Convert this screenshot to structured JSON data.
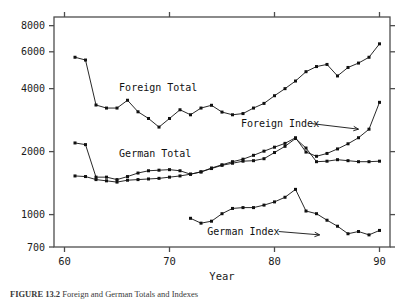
{
  "figure": {
    "caption_label": "FIGURE 13.2",
    "caption_text": "Foreign and German Totals and Indexes"
  },
  "chart_data": {
    "type": "line",
    "title": "",
    "xlabel": "Year",
    "ylabel": "",
    "yscale": "log",
    "ylim": [
      700,
      8800
    ],
    "xlim": [
      59.0,
      91.0
    ],
    "grid": false,
    "legend": "inline-annotations",
    "xticks": [
      60,
      70,
      80,
      90
    ],
    "xticklabels": [
      "60",
      "70",
      "80",
      "90"
    ],
    "yticks": [
      700,
      1000,
      2000,
      4000,
      6000,
      8000
    ],
    "yticklabels": [
      "700",
      "1000",
      "2000",
      "4000",
      "6000",
      "8000"
    ],
    "annotations": [
      {
        "name": "foreign-total-label",
        "text": "Foreign Total",
        "x": 65.2,
        "y": 4050,
        "arrow": false
      },
      {
        "name": "german-total-label",
        "text": "German Total",
        "x": 65.2,
        "y": 1960,
        "arrow": false
      },
      {
        "name": "foreign-index-label",
        "text": "Foreign Index",
        "x": 76.8,
        "y": 2720,
        "arrow": true,
        "arrow_from": [
          83.6,
          2720
        ],
        "arrow_to": [
          88.0,
          2560
        ]
      },
      {
        "name": "german-index-label",
        "text": "German Index",
        "x": 73.6,
        "y": 830,
        "arrow": true,
        "arrow_from": [
          80.4,
          830
        ],
        "arrow_to": [
          84.3,
          800
        ]
      }
    ],
    "series": [
      {
        "name": "Foreign Total",
        "x": [
          61,
          62,
          63,
          64,
          65,
          66,
          67,
          68,
          69,
          70,
          71,
          72,
          73,
          74,
          75,
          76,
          77,
          78,
          79,
          80,
          81,
          82,
          83,
          84,
          85,
          86,
          87,
          88,
          89,
          90
        ],
        "values": [
          5650,
          5480,
          3340,
          3230,
          3230,
          3520,
          3100,
          2880,
          2620,
          2880,
          3170,
          3000,
          3230,
          3330,
          3090,
          3000,
          3040,
          3230,
          3400,
          3700,
          4000,
          4350,
          4820,
          5100,
          5220,
          4600,
          5050,
          5300,
          5650,
          6550
        ]
      },
      {
        "name": "German Total",
        "x": [
          61,
          62,
          63,
          64,
          65,
          66,
          67,
          68,
          69,
          70,
          71,
          72,
          73,
          74,
          75,
          76,
          77,
          78,
          79,
          80,
          81,
          82,
          83,
          84,
          85,
          86,
          87,
          88,
          89,
          90
        ],
        "values": [
          2200,
          2160,
          1510,
          1510,
          1470,
          1520,
          1580,
          1620,
          1630,
          1640,
          1620,
          1560,
          1600,
          1660,
          1720,
          1760,
          1800,
          1810,
          1850,
          1980,
          2120,
          2310,
          2080,
          1790,
          1800,
          1830,
          1810,
          1790,
          1790,
          1800
        ]
      },
      {
        "name": "Foreign Index",
        "x": [
          61,
          62,
          63,
          64,
          65,
          66,
          67,
          68,
          69,
          70,
          71,
          72,
          73,
          74,
          75,
          76,
          77,
          78,
          79,
          80,
          81,
          82,
          83,
          84,
          85,
          86,
          87,
          88,
          89,
          90
        ],
        "values": [
          1530,
          1520,
          1470,
          1450,
          1430,
          1460,
          1470,
          1480,
          1490,
          1510,
          1530,
          1560,
          1600,
          1670,
          1730,
          1790,
          1840,
          1920,
          2010,
          2100,
          2190,
          2330,
          1990,
          1900,
          1960,
          2060,
          2180,
          2330,
          2560,
          3440
        ]
      },
      {
        "name": "German Index",
        "x": [
          72,
          73,
          74,
          75,
          76,
          77,
          78,
          79,
          80,
          81,
          82,
          83,
          84,
          85,
          86,
          87,
          88,
          89,
          90
        ],
        "values": [
          960,
          910,
          930,
          1010,
          1070,
          1080,
          1080,
          1110,
          1150,
          1210,
          1320,
          1040,
          1010,
          940,
          880,
          810,
          830,
          800,
          840
        ]
      }
    ]
  }
}
